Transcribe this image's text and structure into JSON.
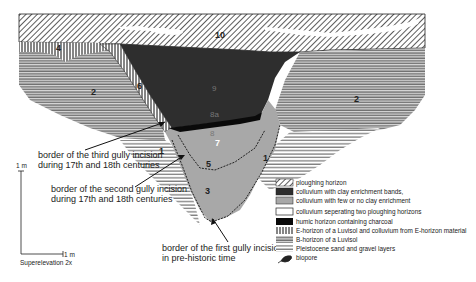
{
  "figure": {
    "type": "soil profile cross-section",
    "unit_labels": {
      "10": "10",
      "4": "4",
      "2_left": "2",
      "2_right": "2",
      "6": "6",
      "9": "9",
      "8a": "8a",
      "8": "8",
      "7": "7",
      "5": "5",
      "3": "3",
      "1_left": "1",
      "1_right": "1"
    },
    "annotations": {
      "third_line1": "border of the third gully incision",
      "third_line2": "during 17th and 18th centuries",
      "second_line1": "border  of the second gully incision",
      "second_line2": "during 17th and 18th centuries",
      "first_line1": "border of the first gully incision",
      "first_line2": "in pre-historic time"
    },
    "scale": {
      "vertical": "1 m",
      "horizontal": "1 m",
      "superelevation": "Superelevation 2x"
    }
  },
  "legend": {
    "items": [
      {
        "pattern": "diagonal-hatch",
        "label": "ploughing horizon"
      },
      {
        "pattern": "dark-fill",
        "label": "colluvium with clay enrichment bands,"
      },
      {
        "pattern": "grey-fill",
        "label": "colluvium with few or no clay enrichment"
      },
      {
        "pattern": "white-fill",
        "label": "colluvium seperating two ploughing horizons"
      },
      {
        "pattern": "black-fill",
        "label": "humic horizon containing charcoal"
      },
      {
        "pattern": "vertical-lines",
        "label": "E-horizon of a Luvisol and colluvium from E-horizon material"
      },
      {
        "pattern": "dense-horizontal-lines",
        "label": "B-horizon of a Luvisol"
      },
      {
        "pattern": "sparse-horizontal-lines",
        "label": "Pleistocene sand and gravel layers"
      },
      {
        "pattern": "biopore-icon",
        "label": "biopore"
      }
    ]
  },
  "colors": {
    "dark_colluvium": "#2e2e2e",
    "grey_colluvium": "#a8a8a8",
    "humic": "#0a0a0a",
    "line": "#222222"
  }
}
